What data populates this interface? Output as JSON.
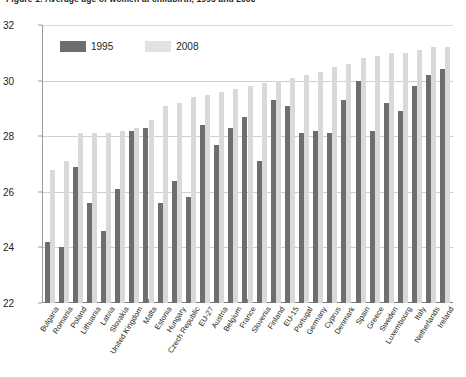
{
  "figure": {
    "title": "Figure 1: Average age of women at childbirth, 1995 and 2008"
  },
  "legend": {
    "position": "top-left",
    "entries": [
      {
        "label": "1995",
        "color": "#6d6e71"
      },
      {
        "label": "2008",
        "color": "#e2e2e2"
      }
    ]
  },
  "axis": {
    "y_ticks": [
      "22",
      "24",
      "26",
      "28",
      "30",
      "32"
    ]
  },
  "chart_data": {
    "type": "bar",
    "title": "Figure 1: Average age of women at childbirth, 1995 and 2008",
    "xlabel": "",
    "ylabel": "",
    "ylim": [
      22,
      32
    ],
    "ytick_step": 2,
    "grid": true,
    "legend_position": "top-left",
    "categories": [
      "Bulgaria",
      "Romania",
      "Poland",
      "Lithuania",
      "Latvia",
      "Slovakia",
      "United Kingdom",
      "Malta",
      "Estonia",
      "Hungary",
      "Czech Republic",
      "EU-27",
      "Austria",
      "Belgium",
      "France",
      "Slovenia",
      "Finland",
      "EU-15",
      "Portugal",
      "Germany",
      "Cyprus",
      "Denmark",
      "Spain",
      "Greece",
      "Sweden",
      "Luxembourg",
      "Italy",
      "Netherlands",
      "Ireland"
    ],
    "series": [
      {
        "name": "1995",
        "color": "#6d6e71",
        "values": [
          24.2,
          24.0,
          26.9,
          25.6,
          24.6,
          26.1,
          28.2,
          28.3,
          25.6,
          26.4,
          25.8,
          28.4,
          27.7,
          28.3,
          28.7,
          27.1,
          29.3,
          29.1,
          28.1,
          28.2,
          28.1,
          29.3,
          30.0,
          28.2,
          29.2,
          28.9,
          29.8,
          30.2,
          30.4
        ]
      },
      {
        "name": "2008",
        "color": "#d9d9d9",
        "values": [
          26.8,
          27.1,
          28.1,
          28.1,
          28.1,
          28.2,
          28.3,
          28.6,
          29.1,
          29.2,
          29.4,
          29.5,
          29.6,
          29.7,
          29.8,
          29.9,
          30.0,
          30.1,
          30.2,
          30.3,
          30.5,
          30.6,
          30.8,
          30.9,
          31.0,
          31.0,
          31.1,
          31.2,
          31.2
        ]
      }
    ]
  }
}
